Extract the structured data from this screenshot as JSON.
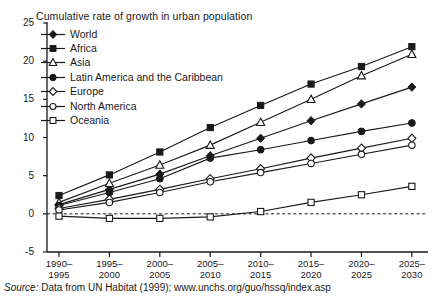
{
  "chart_data": {
    "type": "line",
    "title": "Cumulative rate of growth in urban population",
    "xlabel": "",
    "ylabel": "",
    "ylim": [
      -5,
      25
    ],
    "yticks": [
      -5,
      0,
      5,
      10,
      15,
      20,
      25
    ],
    "ytick_labels": [
      "-5",
      "0",
      "5",
      "10",
      "15",
      "20",
      "25"
    ],
    "grid": false,
    "zero_line": true,
    "legend_position": "top-left",
    "categories": [
      "1990–1995",
      "1995–2000",
      "2000–2005",
      "2005–2010",
      "2010–2015",
      "2015–2020",
      "2020–2025",
      "2025–2030"
    ],
    "category_lines": [
      [
        "1990–",
        "1995"
      ],
      [
        "1995–",
        "2000"
      ],
      [
        "2000–",
        "2005"
      ],
      [
        "2005–",
        "2010"
      ],
      [
        "2010–",
        "2015"
      ],
      [
        "2015–",
        "2020"
      ],
      [
        "2020–",
        "2025"
      ],
      [
        "2025–",
        "2030"
      ]
    ],
    "series": [
      {
        "name": "World",
        "marker": "filled-diamond",
        "values": [
          1.2,
          3.2,
          5.2,
          7.6,
          9.9,
          12.2,
          14.4,
          16.6
        ]
      },
      {
        "name": "Africa",
        "marker": "filled-square",
        "values": [
          2.4,
          5.1,
          8.1,
          11.3,
          14.2,
          17.0,
          19.3,
          21.9
        ]
      },
      {
        "name": "Asia",
        "marker": "open-triangle",
        "values": [
          1.5,
          4.0,
          6.4,
          9.0,
          12.0,
          15.0,
          18.1,
          20.9
        ]
      },
      {
        "name": "Latin America and the Caribbean",
        "marker": "filled-circle",
        "values": [
          1.1,
          2.8,
          4.6,
          7.3,
          8.4,
          9.6,
          10.8,
          11.9
        ]
      },
      {
        "name": "Europe",
        "marker": "open-diamond",
        "values": [
          0.7,
          1.9,
          3.2,
          4.6,
          5.9,
          7.3,
          8.6,
          9.9
        ]
      },
      {
        "name": "North America",
        "marker": "open-circle",
        "values": [
          0.5,
          1.5,
          2.8,
          4.2,
          5.4,
          6.6,
          7.8,
          9.0
        ]
      },
      {
        "name": "Oceania",
        "marker": "open-square",
        "values": [
          -0.3,
          -0.6,
          -0.6,
          -0.4,
          0.3,
          1.5,
          2.5,
          3.6
        ]
      }
    ]
  },
  "source": {
    "prefix": "Source:",
    "text": "Data from UN Habitat (1999); www.unchs.org/guo/hssq/index.asp"
  }
}
